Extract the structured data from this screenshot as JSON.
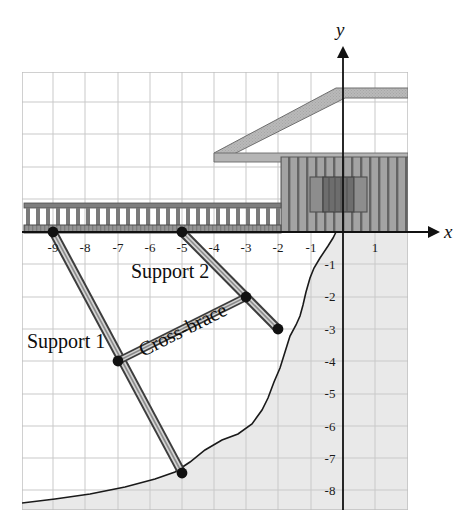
{
  "figure": {
    "type": "coordinate-diagram",
    "axis": {
      "x_label": "x",
      "y_label": "y",
      "x_ticks": [
        "-9",
        "-8",
        "-7",
        "-6",
        "-5",
        "-4",
        "-3",
        "-2",
        "-1",
        "1"
      ],
      "x_tick_values": [
        -9,
        -8,
        -7,
        -6,
        -5,
        -4,
        -3,
        -2,
        -1,
        1
      ],
      "y_ticks": [
        "-1",
        "-2",
        "-3",
        "-4",
        "-5",
        "-6",
        "-7",
        "-8"
      ],
      "y_tick_values": [
        -1,
        -2,
        -3,
        -4,
        -5,
        -6,
        -7,
        -8
      ],
      "xlim": [
        -9.6,
        2.0
      ],
      "ylim": [
        -8.55,
        4.9
      ],
      "grid": true
    },
    "annotations": [
      {
        "id": "support1",
        "text": "Support 1"
      },
      {
        "id": "support2",
        "text": "Support 2"
      },
      {
        "id": "crossbrace",
        "text": "Cross-brace"
      }
    ],
    "members": [
      {
        "name": "Support 1",
        "from": [
          -9,
          0
        ],
        "to": [
          -5,
          -7.8
        ]
      },
      {
        "name": "Support 2",
        "from": [
          -5,
          0
        ],
        "to": [
          -2,
          -3
        ]
      },
      {
        "name": "Cross-brace",
        "from": [
          -7,
          -4
        ],
        "to": [
          -3,
          -2
        ]
      }
    ],
    "points": [
      {
        "label": "",
        "x": -9,
        "y": 0
      },
      {
        "label": "",
        "x": -5,
        "y": 0
      },
      {
        "label": "",
        "x": -7,
        "y": -4
      },
      {
        "label": "",
        "x": -5,
        "y": -7.8
      },
      {
        "label": "",
        "x": -3,
        "y": -2
      },
      {
        "label": "",
        "x": -2,
        "y": -3
      }
    ],
    "colors": {
      "grid": "#c9c9c9",
      "axis": "#111111",
      "ground_fill": "#e8e8e8",
      "roof": "#b7b7b7",
      "siding": "#9e9e9e",
      "siding_line": "#5d5d5d",
      "deck": "#8f8f8f",
      "beam_fill": "#d0d0d0",
      "beam_edge": "#4a4a4a",
      "dot": "#111111",
      "window": "#8a8a8a",
      "shutter": "#676767"
    }
  }
}
